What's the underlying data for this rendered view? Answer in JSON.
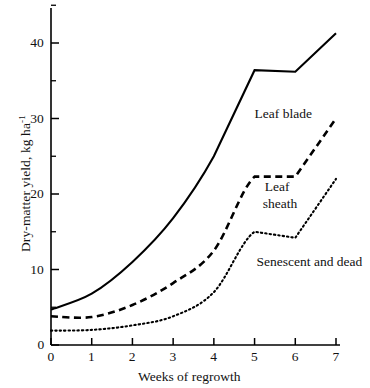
{
  "chart_data": {
    "type": "line",
    "title": "",
    "subtitle": "",
    "xlabel": "Weeks of regrowth",
    "ylabel": "Dry-matter yield, kg ha-1",
    "ylabel_base": "Dry-matter yield, kg ha",
    "ylabel_exponent": "-1",
    "x": [
      0,
      1,
      2,
      3,
      4,
      5,
      6,
      7
    ],
    "xlim": [
      0,
      7
    ],
    "ylim": [
      0,
      45
    ],
    "xticks": [
      "0",
      "1",
      "2",
      "3",
      "4",
      "5",
      "6",
      "7"
    ],
    "yticks": [
      "0",
      "10",
      "20",
      "30",
      "40"
    ],
    "ytick_values": [
      0,
      10,
      20,
      30,
      40
    ],
    "yminor_values": [
      5,
      15,
      25,
      35,
      45
    ],
    "grid": false,
    "legend_position": "inline-annotations",
    "series": [
      {
        "name": "Leaf blade",
        "style": "solid",
        "color": "#000000",
        "values": [
          4.7,
          6.8,
          11.0,
          16.8,
          25.0,
          36.4,
          36.2,
          41.3
        ]
      },
      {
        "name": "Leaf sheath",
        "style": "dashed",
        "color": "#000000",
        "values": [
          3.8,
          3.7,
          5.3,
          8.2,
          12.5,
          22.3,
          22.3,
          30.0
        ]
      },
      {
        "name": "Senescent and dead",
        "style": "dotted",
        "color": "#000000",
        "values": [
          1.9,
          2.0,
          2.6,
          3.8,
          7.0,
          15.0,
          14.2,
          22.0
        ]
      }
    ],
    "annotations": [
      {
        "text": "Leaf blade",
        "x": 5.0,
        "y": 30.5
      },
      {
        "text": "Leaf",
        "x": 5.25,
        "y": 20.8
      },
      {
        "text": "sheath",
        "x": 5.2,
        "y": 18.6
      },
      {
        "text": "Senescent and dead",
        "x": 5.05,
        "y": 10.8
      }
    ]
  },
  "axes": {
    "x_title": "Weeks of regrowth",
    "y_title_base": "Dry-matter yield, kg ha",
    "y_title_exp": "-1",
    "x_tick_0": "0",
    "x_tick_1": "1",
    "x_tick_2": "2",
    "x_tick_3": "3",
    "x_tick_4": "4",
    "x_tick_5": "5",
    "x_tick_6": "6",
    "x_tick_7": "7",
    "y_tick_0": "0",
    "y_tick_10": "10",
    "y_tick_20": "20",
    "y_tick_30": "30",
    "y_tick_40": "40"
  },
  "annotations": {
    "leaf_blade": "Leaf blade",
    "leaf_sheath_line1": "Leaf",
    "leaf_sheath_line2": "sheath",
    "senescent": "Senescent and dead"
  },
  "colors": {
    "ink": "#000000",
    "background": "#ffffff"
  }
}
